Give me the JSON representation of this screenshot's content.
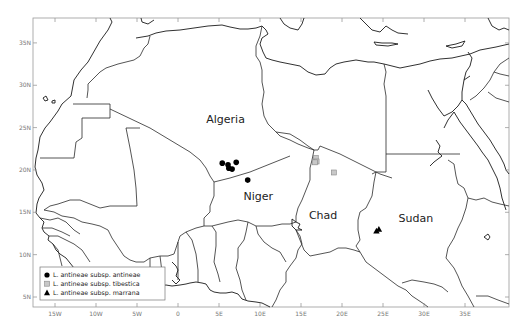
{
  "map": {
    "type": "distribution-map",
    "region": "North and West Africa",
    "lon_range": [
      -18,
      40
    ],
    "lat_range": [
      4,
      38
    ],
    "x_ticks": [
      {
        "value": -15,
        "label": "15W"
      },
      {
        "value": -10,
        "label": "10W"
      },
      {
        "value": -5,
        "label": "5W"
      },
      {
        "value": 0,
        "label": "0"
      },
      {
        "value": 5,
        "label": "5E"
      },
      {
        "value": 10,
        "label": "10E"
      },
      {
        "value": 15,
        "label": "15E"
      },
      {
        "value": 20,
        "label": "20E"
      },
      {
        "value": 25,
        "label": "25E"
      },
      {
        "value": 30,
        "label": "30E"
      },
      {
        "value": 35,
        "label": "35E"
      }
    ],
    "y_ticks": [
      {
        "value": 35,
        "label": "35N"
      },
      {
        "value": 30,
        "label": "30N"
      },
      {
        "value": 25,
        "label": "25N"
      },
      {
        "value": 20,
        "label": "20N"
      },
      {
        "value": 15,
        "label": "15N"
      },
      {
        "value": 10,
        "label": "10N"
      },
      {
        "value": 5,
        "label": "5N"
      }
    ],
    "country_labels": [
      {
        "name": "Algeria",
        "lon": 5.8,
        "lat": 25.6
      },
      {
        "name": "Niger",
        "lon": 9.8,
        "lat": 16.5
      },
      {
        "name": "Chad",
        "lon": 17.7,
        "lat": 14.2
      },
      {
        "name": "Sudan",
        "lon": 29.0,
        "lat": 13.9
      }
    ]
  },
  "chart_data": {
    "type": "scatter",
    "title": "",
    "xlabel": "",
    "ylabel": "",
    "xlim": [
      -18,
      40
    ],
    "ylim": [
      4,
      38
    ],
    "grid": false,
    "legend_position": "bottom-left",
    "series": [
      {
        "name": "L. antineae subsp. antineae",
        "marker": "circle",
        "color": "#000000",
        "points": [
          {
            "lon": 5.4,
            "lat": 20.8
          },
          {
            "lon": 6.1,
            "lat": 20.6
          },
          {
            "lon": 7.1,
            "lat": 20.9
          },
          {
            "lon": 6.2,
            "lat": 20.2
          },
          {
            "lon": 6.6,
            "lat": 20.1
          },
          {
            "lon": 8.5,
            "lat": 18.8
          }
        ]
      },
      {
        "name": "L. antineae subsp. tibestica",
        "marker": "square",
        "color": "#c8c8c8",
        "points": [
          {
            "lon": 16.8,
            "lat": 21.4
          },
          {
            "lon": 16.9,
            "lat": 21.0
          },
          {
            "lon": 16.7,
            "lat": 20.9
          },
          {
            "lon": 19.0,
            "lat": 19.7
          }
        ]
      },
      {
        "name": "L. antineae subsp. marrana",
        "marker": "triangle",
        "color": "#000000",
        "points": [
          {
            "lon": 24.2,
            "lat": 12.8
          },
          {
            "lon": 24.5,
            "lat": 13.0
          }
        ]
      }
    ]
  },
  "legend": {
    "items": [
      {
        "label": "L. antineae subsp. antineae",
        "marker": "circle"
      },
      {
        "label": "L. antineae subsp. tibestica",
        "marker": "square"
      },
      {
        "label": "L. antineae subsp. marrana",
        "marker": "triangle"
      }
    ]
  }
}
